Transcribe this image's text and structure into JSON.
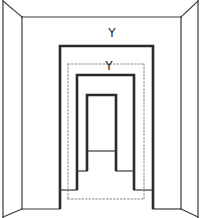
{
  "diagram": {
    "type": "corridor-size-illusion",
    "background": "#ffffff",
    "line_color": "#2a2a2a",
    "thin_color": "#3a3a3a",
    "dotted_color": "#8a8a8a",
    "room": {
      "outer_left_x": 3,
      "outer_right_x": 198,
      "outer_top_y": 1,
      "outer_bottom_y": 217,
      "back_left_x": 22,
      "back_right_x": 181,
      "back_top_y": 17,
      "back_bottom_y": 209
    },
    "frames": [
      {
        "name": "near-frame",
        "left": 60,
        "right": 153,
        "top": 46,
        "bottom": 209,
        "ledge_y": 190,
        "ledge_inner_left": 77,
        "ledge_inner_right": 134
      },
      {
        "name": "middle-frame",
        "left": 77,
        "right": 134,
        "top": 75,
        "bottom": 190,
        "ledge_y": 171,
        "ledge_inner_left": 87,
        "ledge_inner_right": 116
      },
      {
        "name": "far-frame",
        "left": 87,
        "right": 116,
        "top": 95,
        "bottom": 171,
        "floor_y": 151
      }
    ],
    "dotted_rect": {
      "left": 68,
      "right": 144,
      "top": 64,
      "bottom": 199
    },
    "labels": [
      {
        "text": "Y",
        "x": 112,
        "y": 27
      },
      {
        "text": "Y",
        "x": 109,
        "y": 60
      }
    ]
  }
}
